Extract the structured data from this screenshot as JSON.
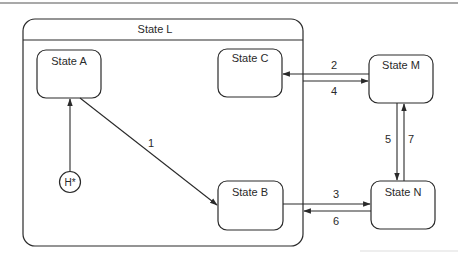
{
  "diagram": {
    "type": "statechart",
    "composite_state": {
      "id": "L",
      "label": "State L"
    },
    "states": [
      {
        "id": "A",
        "label": "State A"
      },
      {
        "id": "B",
        "label": "State B"
      },
      {
        "id": "C",
        "label": "State C"
      },
      {
        "id": "M",
        "label": "State M"
      },
      {
        "id": "N",
        "label": "State N"
      }
    ],
    "history": {
      "label": "H*"
    },
    "transitions": [
      {
        "label": "1",
        "from": "A",
        "to": "B"
      },
      {
        "label": "2",
        "from": "M",
        "to": "C"
      },
      {
        "label": "3",
        "from": "B",
        "to": "N"
      },
      {
        "label": "4",
        "from": "L",
        "to": "M"
      },
      {
        "label": "5",
        "from": "M",
        "to": "N"
      },
      {
        "label": "6",
        "from": "N",
        "to": "L"
      },
      {
        "label": "7",
        "from": "N",
        "to": "M"
      }
    ],
    "colors": {
      "stroke": "#2a2a2a",
      "background": "#ffffff"
    }
  }
}
